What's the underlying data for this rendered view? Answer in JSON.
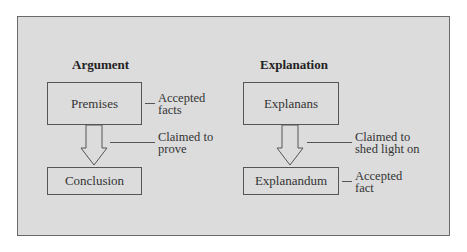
{
  "figure": {
    "argument": {
      "title": "Argument",
      "top_box": "Premises",
      "top_note_line1": "Accepted",
      "top_note_line2": "facts",
      "arrow_note_line1": "Claimed to",
      "arrow_note_line2": "prove",
      "bottom_box": "Conclusion"
    },
    "explanation": {
      "title": "Explanation",
      "top_box": "Explanans",
      "arrow_note_line1": "Claimed to",
      "arrow_note_line2": "shed light on",
      "bottom_box": "Explanandum",
      "bottom_note_line1": "Accepted",
      "bottom_note_line2": "fact"
    },
    "colors": {
      "panel_background": "#dcdcdc",
      "border": "#555555"
    }
  }
}
